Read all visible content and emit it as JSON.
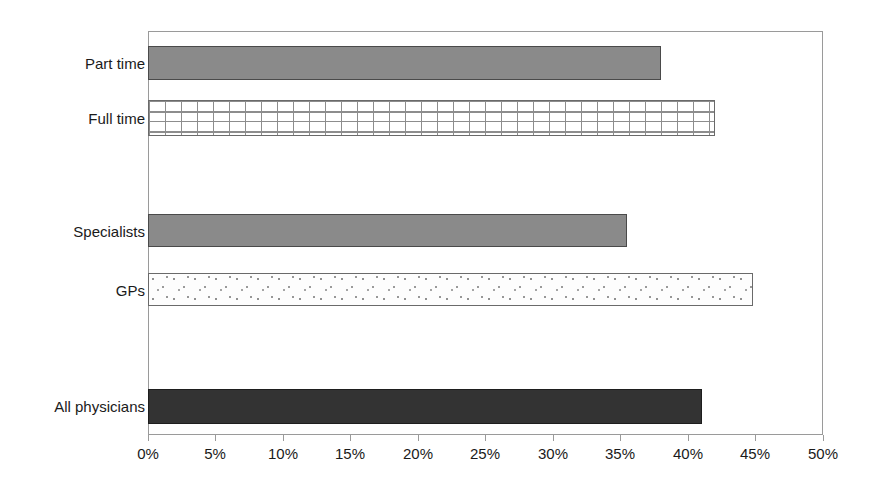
{
  "chart_data": {
    "type": "bar",
    "orientation": "horizontal",
    "title": "",
    "subtitle": "",
    "xlabel": "",
    "ylabel": "",
    "xlim": [
      0,
      50
    ],
    "grid": false,
    "legend": false,
    "categories": [
      "Part time",
      "Full time",
      "Specialists",
      "GPs",
      "All physicians"
    ],
    "values": [
      38,
      42,
      35.5,
      44.8,
      41
    ],
    "tick_labels": [
      "0%",
      "5%",
      "10%",
      "15%",
      "20%",
      "25%",
      "30%",
      "35%",
      "40%",
      "45%",
      "50%"
    ],
    "tick_values": [
      0,
      5,
      10,
      15,
      20,
      25,
      30,
      35,
      40,
      45,
      50
    ],
    "bars": [
      {
        "label": "Part time",
        "value": 38,
        "fill": "solid-gray",
        "color": "#8a8a8a"
      },
      {
        "label": "Full time",
        "value": 42,
        "fill": "brick",
        "color": "#ffffff"
      },
      {
        "label": "Specialists",
        "value": 35.5,
        "fill": "solid-gray",
        "color": "#8a8a8a"
      },
      {
        "label": "GPs",
        "value": 44.8,
        "fill": "confetti",
        "color": "#fdfdfd"
      },
      {
        "label": "All physicians",
        "value": 41,
        "fill": "solid-dark",
        "color": "#333333"
      }
    ]
  },
  "colors": {
    "background": "#ffffff",
    "frame": "#9a9a9a",
    "text": "#1a1a1a",
    "bar_gray": "#8a8a8a",
    "bar_dark": "#333333",
    "bar_outline": "#555555"
  }
}
